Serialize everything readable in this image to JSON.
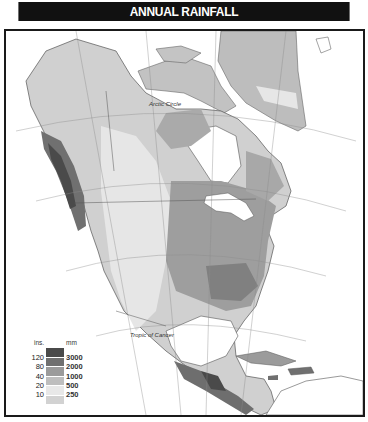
{
  "header": {
    "title": "ANNUAL RAINFALL"
  },
  "map": {
    "labels": {
      "arctic_circle": "Arctic Circle",
      "tropic_of_cancer": "Tropic of Cancer"
    },
    "colors": {
      "frame": "#1a1a1a",
      "ocean": "#ffffff",
      "border_lines": "#5a5a5a",
      "graticule": "#8a8a8a"
    }
  },
  "legend": {
    "unit_ins": "ins.",
    "unit_mm": "mm",
    "classes": [
      {
        "ins": "120",
        "mm": "3000",
        "color": "#4a4a4a"
      },
      {
        "ins": "80",
        "mm": "2000",
        "color": "#707070"
      },
      {
        "ins": "40",
        "mm": "1000",
        "color": "#9b9b9b"
      },
      {
        "ins": "20",
        "mm": "500",
        "color": "#bebebe"
      },
      {
        "ins": "10",
        "mm": "250",
        "color": "#e8e8e8"
      }
    ],
    "lowest_color": "#d2d2d2"
  }
}
